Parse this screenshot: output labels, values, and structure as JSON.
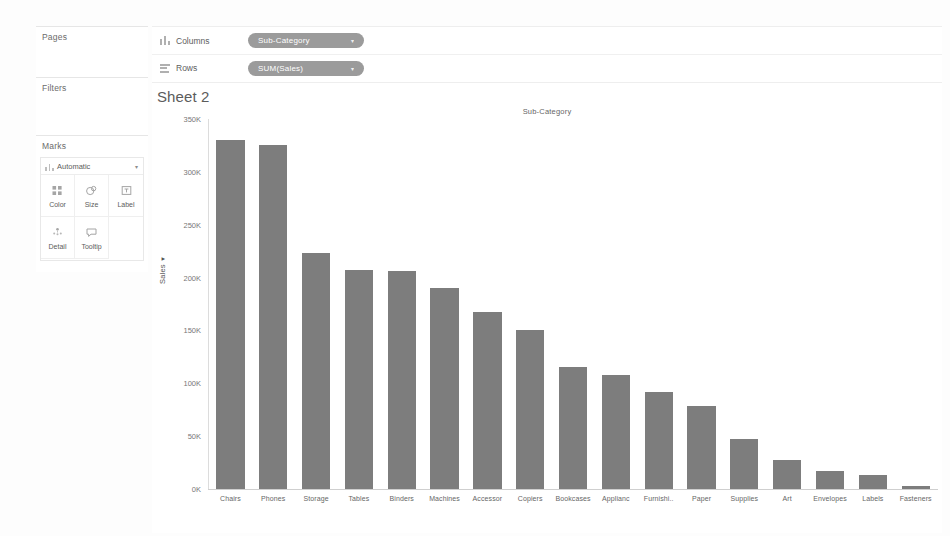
{
  "left_panel": {
    "pages_label": "Pages",
    "filters_label": "Filters",
    "marks_label": "Marks",
    "mark_type": {
      "value": "Automatic",
      "icon": "bar-mark-icon",
      "caret": "▾"
    },
    "buttons": [
      {
        "label": "Color",
        "icon": "color-squares-icon"
      },
      {
        "label": "Size",
        "icon": "size-circles-icon"
      },
      {
        "label": "Label",
        "icon": "label-text-box-icon"
      },
      {
        "label": "Detail",
        "icon": "detail-dots-icon"
      },
      {
        "label": "Tooltip",
        "icon": "tooltip-speech-bubble-icon"
      }
    ]
  },
  "shelves": {
    "columns": {
      "name": "Columns",
      "icon": "columns-glyph-icon",
      "pill": {
        "text": "Sub-Category",
        "caret": "▾"
      }
    },
    "rows": {
      "name": "Rows",
      "icon": "rows-glyph-icon",
      "pill": {
        "text": "SUM(Sales)",
        "caret": "▾"
      }
    }
  },
  "worksheet": {
    "sheet_title": "Sheet 2",
    "column_header": "Sub-Category"
  },
  "colors": {
    "bar": "#7d7d7d",
    "pill": "#9b9b9b",
    "axis": "#dcdcdc",
    "text": "#666666"
  },
  "chart_data": {
    "type": "bar",
    "title": "Sub-Category",
    "xlabel": "Sub-Category",
    "ylabel": "Sales",
    "ylim": [
      0,
      350000
    ],
    "ytick_values": [
      0,
      50000,
      100000,
      150000,
      200000,
      250000,
      300000,
      350000
    ],
    "ytick_labels": [
      "0K",
      "50K",
      "100K",
      "150K",
      "200K",
      "250K",
      "300K",
      "350K"
    ],
    "grid": false,
    "legend": "none",
    "sort": "descending",
    "categories": [
      "Chairs",
      "Phones",
      "Storage",
      "Tables",
      "Binders",
      "Machines",
      "Accessor",
      "Copiers",
      "Bookcases",
      "Applianc",
      "Furnishi..",
      "Paper",
      "Supplies",
      "Art",
      "Envelopes",
      "Labels",
      "Fasteners"
    ],
    "values": [
      330000,
      325000,
      223000,
      207000,
      206000,
      190000,
      167000,
      150000,
      115000,
      108000,
      92000,
      79000,
      47000,
      27000,
      17000,
      13000,
      3000
    ]
  }
}
